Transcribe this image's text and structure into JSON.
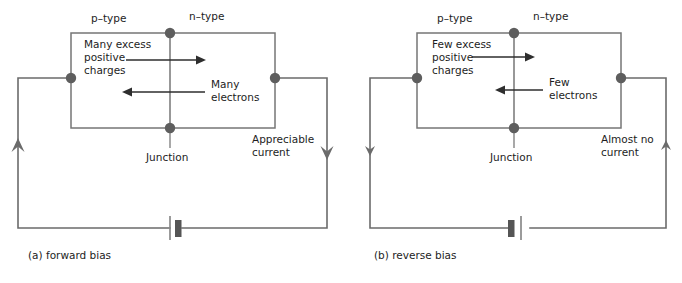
{
  "figure": {
    "colors": {
      "wire": "#6b6b6b",
      "box": "#767676",
      "node": "#5e5e5e",
      "arrow": "#2e2e2e",
      "text": "#1d1d1d",
      "background": "#ffffff"
    }
  },
  "panels": [
    {
      "id": "forward",
      "caption": "(a) forward bias",
      "left_region_label": "p–type",
      "right_region_label": "n–type",
      "holes_label_line1": "Many excess",
      "holes_label_line2": "positive",
      "holes_label_line3": "charges",
      "electrons_label_line1": "Many",
      "electrons_label_line2": "electrons",
      "junction_label": "Junction",
      "current_label_line1": "Appreciable",
      "current_label_line2": "current",
      "hole_arrow_direction": "right",
      "electron_arrow_direction": "left",
      "left_current_arrow_direction": "up",
      "right_current_arrow_direction": "down",
      "battery_orientation": "long-plate-left"
    },
    {
      "id": "reverse",
      "caption": "(b) reverse bias",
      "left_region_label": "p–type",
      "right_region_label": "n–type",
      "holes_label_line1": "Few excess",
      "holes_label_line2": "positive",
      "holes_label_line3": "charges",
      "electrons_label_line1": "Few",
      "electrons_label_line2": "electrons",
      "junction_label": "Junction",
      "current_label_line1": "Almost no",
      "current_label_line2": "current",
      "hole_arrow_direction": "right",
      "electron_arrow_direction": "left",
      "left_current_arrow_direction": "down",
      "right_current_arrow_direction": "up",
      "battery_orientation": "long-plate-right"
    }
  ]
}
